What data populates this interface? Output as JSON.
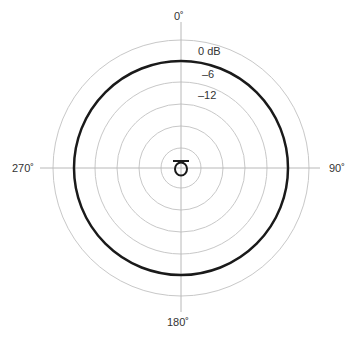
{
  "diagram": {
    "type": "polar-pattern",
    "pattern": "omnidirectional",
    "angle_labels": {
      "top": "0˚",
      "right": "90˚",
      "bottom": "180˚",
      "left": "270˚"
    },
    "db_labels": [
      "0 dB",
      "–6",
      "–12"
    ],
    "colors": {
      "grid": "#c8c8c8",
      "axis": "#b0b0b0",
      "pattern": "#1a1a1a",
      "text": "#333333"
    },
    "icon": "microphone-capsule-icon"
  }
}
